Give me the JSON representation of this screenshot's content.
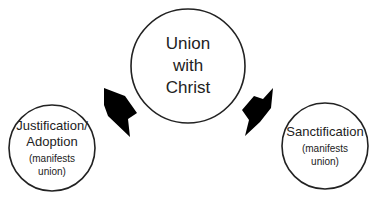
{
  "center": {
    "lines": [
      "Union",
      "with",
      "Christ"
    ]
  },
  "left": {
    "title_lines": [
      "Justification/",
      "Adoption"
    ],
    "note_lines": [
      "(manifests",
      "union)"
    ]
  },
  "right": {
    "title_lines": [
      "Sanctification"
    ],
    "note_lines": [
      "(manifests",
      "union)"
    ]
  },
  "colors": {
    "stroke": "#222222",
    "arrow": "#000000",
    "background": "#ffffff"
  }
}
